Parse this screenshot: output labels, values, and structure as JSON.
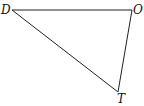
{
  "diagram": {
    "type": "triangle",
    "stroke_color": "#222222",
    "vertices": [
      {
        "name": "D",
        "x": 12,
        "y": 10
      },
      {
        "name": "O",
        "x": 132,
        "y": 10
      },
      {
        "name": "T",
        "x": 118,
        "y": 92
      }
    ],
    "labels": {
      "d": "D",
      "o": "O",
      "t": "T"
    },
    "edges": [
      [
        "D",
        "O"
      ],
      [
        "O",
        "T"
      ],
      [
        "T",
        "D"
      ]
    ]
  }
}
